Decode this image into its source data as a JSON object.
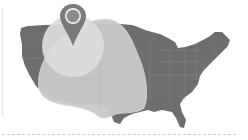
{
  "map": {
    "subject": "United States coverage map",
    "colors": {
      "land": "#6e6e6e",
      "state_borders": "#8a8a8a",
      "coverage_large": "#c9c9c9",
      "coverage_small": "#dcdcdc",
      "pin": "#7a7a7a",
      "pin_inner": "#8c8c8c",
      "pin_ring": "#eeeeee",
      "divider": "#cfcfcf"
    },
    "icons": {
      "pin": "map-marker-icon"
    }
  }
}
